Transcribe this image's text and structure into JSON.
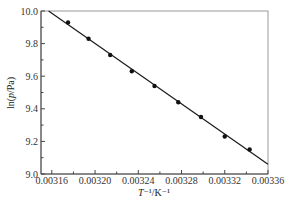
{
  "chart_data": {
    "type": "scatter",
    "title": "",
    "xlabel": "T⁻¹/K⁻¹",
    "ylabel": "ln(p/Pa)",
    "xlim": [
      0.00315,
      0.00336
    ],
    "ylim": [
      9.0,
      10.0
    ],
    "x_ticks": [
      "0.00316",
      "0.00320",
      "0.00324",
      "0.00328",
      "0.00332",
      "0.00336"
    ],
    "x_tick_values": [
      0.00316,
      0.0032,
      0.00324,
      0.00328,
      0.00332,
      0.00336
    ],
    "x_minor_ticks": [
      0.00318,
      0.00322,
      0.00326,
      0.0033,
      0.00334
    ],
    "y_ticks": [
      "9.0",
      "9.2",
      "9.4",
      "9.6",
      "9.8",
      "10.0"
    ],
    "y_tick_values": [
      9.0,
      9.2,
      9.4,
      9.6,
      9.8,
      10.0
    ],
    "y_minor_ticks": [
      9.1,
      9.3,
      9.5,
      9.7,
      9.9
    ],
    "grid": false,
    "legend": null,
    "series": [
      {
        "name": "data",
        "kind": "scatter",
        "marker": "circle",
        "x": [
          0.003175,
          0.003194,
          0.003214,
          0.003234,
          0.003255,
          0.003277,
          0.003298,
          0.00332,
          0.003343
        ],
        "y": [
          9.93,
          9.83,
          9.73,
          9.63,
          9.54,
          9.44,
          9.35,
          9.23,
          9.15
        ]
      },
      {
        "name": "linear fit",
        "kind": "line",
        "x": [
          0.003157,
          0.00336
        ],
        "y": [
          10.0,
          9.06
        ]
      }
    ]
  },
  "colors": {
    "frame": "#9a9a9a",
    "line": "#1a1a1a",
    "marker": "#111111"
  }
}
